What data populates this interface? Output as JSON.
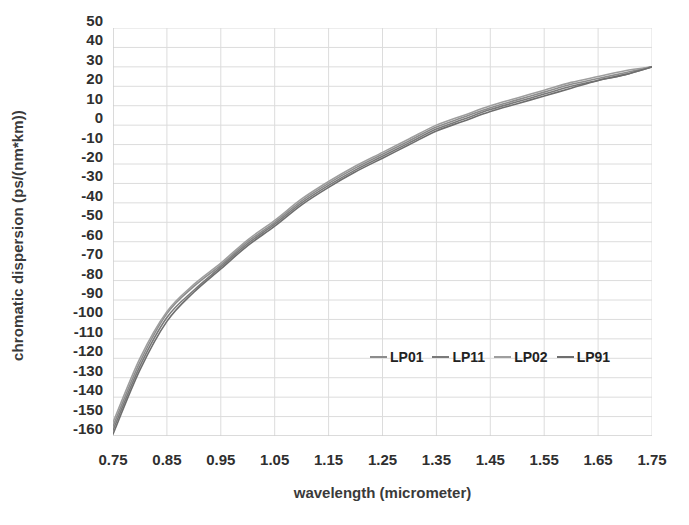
{
  "chart_data": {
    "type": "line",
    "title": "",
    "xlabel": "wavelength (micrometer)",
    "ylabel": "chromatic dispersion (ps/(nm*km))",
    "xlim": [
      0.75,
      1.75
    ],
    "ylim": [
      -160,
      50
    ],
    "grid": true,
    "legend_position": "inside-lower-right",
    "xticks": [
      "0.75",
      "0.85",
      "0.95",
      "1.05",
      "1.15",
      "1.25",
      "1.35",
      "1.45",
      "1.55",
      "1.65",
      "1.75"
    ],
    "yticks": [
      "50",
      "40",
      "30",
      "20",
      "10",
      "0",
      "-10",
      "-20",
      "-30",
      "-40",
      "-50",
      "-60",
      "-70",
      "-80",
      "-90",
      "-100",
      "-110",
      "-120",
      "-130",
      "-140",
      "-150",
      "-160"
    ],
    "x": [
      0.75,
      0.8,
      0.85,
      0.9,
      0.95,
      1.0,
      1.05,
      1.1,
      1.15,
      1.2,
      1.25,
      1.3,
      1.35,
      1.4,
      1.45,
      1.5,
      1.55,
      1.6,
      1.65,
      1.7,
      1.75
    ],
    "series": [
      {
        "name": "LP01",
        "color": "#8c8c8c",
        "values": [
          -155,
          -122,
          -97,
          -83,
          -72,
          -60,
          -50,
          -39,
          -30,
          -22,
          -15,
          -8,
          -1,
          4,
          9,
          13,
          17,
          21,
          24,
          27,
          30
        ]
      },
      {
        "name": "LP11",
        "color": "#7a7a7a",
        "values": [
          -157,
          -124,
          -99,
          -85,
          -73,
          -61,
          -51,
          -40,
          -31,
          -23,
          -16,
          -9,
          -2,
          3,
          8,
          12,
          16,
          20,
          23,
          26,
          30
        ]
      },
      {
        "name": "LP02",
        "color": "#9e9e9e",
        "values": [
          -153,
          -120,
          -96,
          -82,
          -71,
          -59,
          -49,
          -38,
          -29,
          -21,
          -14,
          -7,
          0,
          5,
          10,
          14,
          18,
          22,
          25,
          28,
          30
        ]
      },
      {
        "name": "LP91",
        "color": "#6e6e6e",
        "values": [
          -159,
          -126,
          -101,
          -86,
          -74,
          -62,
          -52,
          -41,
          -32,
          -24,
          -17,
          -10,
          -3,
          2,
          7,
          11,
          15,
          19,
          23,
          26,
          30
        ]
      }
    ]
  },
  "axes": {
    "y_title": "chromatic dispersion (ps/(nm*km))",
    "x_title": "wavelength (micrometer)"
  },
  "legend": {
    "entries": [
      {
        "label": "LP01",
        "color": "#8c8c8c"
      },
      {
        "label": "LP11",
        "color": "#7a7a7a"
      },
      {
        "label": "LP02",
        "color": "#9e9e9e"
      },
      {
        "label": "LP91",
        "color": "#6e6e6e"
      }
    ]
  },
  "style": {
    "gridline_color": "#dcdcdc",
    "axis_color": "#c8c8c8",
    "plot_background": "#ffffff",
    "tick_text_color": "#2f2f2f"
  }
}
